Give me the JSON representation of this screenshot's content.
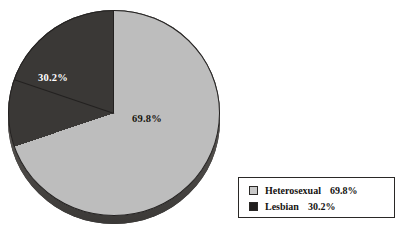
{
  "chart_data": {
    "type": "pie",
    "title": "",
    "subtitle": "",
    "xlabel": "",
    "ylabel": "",
    "grid": false,
    "legend_position": "bottom-right",
    "categories": [
      "Heterosexual",
      "Lesbian"
    ],
    "values": [
      69.8,
      30.2
    ],
    "units": "percent",
    "start_angle_deg": 0,
    "direction": "clockwise",
    "slices": [
      {
        "label": "Heterosexual",
        "value": 69.8,
        "value_text": "69.8%",
        "color": "#bdbdbd",
        "data_label": "69.8%",
        "data_label_color": "#17150f"
      },
      {
        "label": "Lesbian",
        "value": 30.2,
        "value_text": "30.2%",
        "color": "#3a3836",
        "data_label": "30.2%",
        "data_label_color": "#ffffff"
      }
    ],
    "annotations": []
  },
  "pie": {
    "labels": {
      "lesbian": "30.2%",
      "heterosexual": "69.8%"
    }
  },
  "legend": {
    "rows": [
      {
        "label": "Heterosexual",
        "value": "69.8%",
        "swatch": "light-gray-swatch",
        "color": "#c9c9c9"
      },
      {
        "label": "Lesbian",
        "value": "30.2%",
        "swatch": "black-swatch",
        "color": "#201e1d"
      }
    ]
  },
  "colors": {
    "background": "#ffffff",
    "slice_light": "#bdbdbd",
    "slice_dark": "#3a3836",
    "outline": "#232120",
    "depth": "#2e2c2b",
    "text": "#141210"
  }
}
